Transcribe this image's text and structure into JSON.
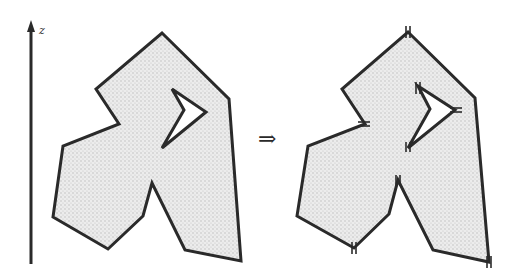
{
  "figure": {
    "axis_label": "z",
    "transform_symbol": "⇒",
    "left_panel": {
      "description": "polygon with hole, shaded",
      "outer": [
        [
          162,
          33
        ],
        [
          229,
          99
        ],
        [
          241,
          261
        ],
        [
          185,
          250
        ],
        [
          152,
          183
        ],
        [
          143,
          216
        ],
        [
          108,
          249
        ],
        [
          53,
          217
        ],
        [
          63,
          146
        ],
        [
          119,
          124
        ],
        [
          96,
          89
        ]
      ],
      "hole": [
        [
          172,
          89
        ],
        [
          206,
          112
        ],
        [
          162,
          148
        ],
        [
          184,
          110
        ]
      ]
    },
    "right_panel": {
      "description": "same polygon split at vertices along z (marked with double ticks)",
      "outer": [
        [
          408,
          32
        ],
        [
          475,
          98
        ],
        [
          489,
          262
        ],
        [
          433,
          250
        ],
        [
          398,
          180
        ],
        [
          389,
          214
        ],
        [
          354,
          248
        ],
        [
          297,
          216
        ],
        [
          308,
          146
        ],
        [
          365,
          124
        ],
        [
          342,
          89
        ]
      ],
      "hole": [
        [
          418,
          86
        ],
        [
          455,
          110
        ],
        [
          408,
          148
        ],
        [
          430,
          109
        ]
      ],
      "split_marks": [
        [
          408,
          32
        ],
        [
          365,
          124
        ],
        [
          455,
          110
        ],
        [
          408,
          148
        ],
        [
          398,
          180
        ],
        [
          354,
          248
        ],
        [
          489,
          262
        ],
        [
          418,
          86
        ]
      ]
    },
    "colors": {
      "stroke": "#2a2a2a",
      "fill": "#e4e4e4",
      "background": "#ffffff"
    }
  }
}
